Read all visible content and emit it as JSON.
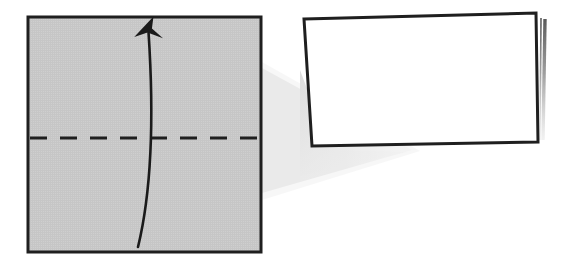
{
  "figure": {
    "kind": "origami-fold-step",
    "background_color": "#ffffff",
    "ink_color": "#1a1a1a",
    "panel_count": 2
  },
  "palette": {
    "paper_gray": "#c6c6c6",
    "paper_gray_light": "#cfcfcf",
    "paper_white": "#ffffff",
    "outline": "#1f1f1f",
    "outline_soft": "#3a3a3a",
    "beam_shadow": "#e2e2e2",
    "beam_shadow_soft": "#ededed",
    "back_layer_edge": "#9a9a9a",
    "drop_shadow": "#e6e6e6"
  },
  "before_panel": {
    "name": "unfolded-sheet",
    "label": "Gray square sheet, unfolded",
    "shape": "square",
    "fill": "#c6c6c6",
    "stroke": "#1f1f1f",
    "stroke_width": 3,
    "x": 28,
    "y": 17,
    "width": 233,
    "height": 235,
    "crease": {
      "name": "horizontal-valley-crease",
      "label": "Horizontal crease line (fold here)",
      "style": "dashed",
      "y": 138,
      "x_start": 30,
      "x_end": 260,
      "stroke": "#1f1f1f",
      "stroke_width": 3,
      "dash_pattern": "17 13"
    },
    "fold_arrow": {
      "name": "fold-direction-arrow",
      "label": "Curved arrow: fold bottom edge up",
      "direction": "upward",
      "stroke": "#1a1a1a",
      "stroke_width": 2.6,
      "tail_x": 138,
      "tail_y": 247,
      "tip_x": 149,
      "tip_y": 22,
      "bulge": "left",
      "head_length": 26,
      "head_width": 15
    }
  },
  "transition": {
    "name": "motion-beam",
    "label": "Light gray beam connecting the two steps",
    "fill": "#e4e4e4",
    "from_x": 262,
    "from_top_y": 68,
    "from_bottom_y": 193,
    "apex_x": 412,
    "apex_y": 150
  },
  "after_panel": {
    "name": "folded-sheet",
    "label": "White rectangle, folded in half",
    "shape": "parallelogram",
    "fill": "#ffffff",
    "stroke": "#1f1f1f",
    "stroke_width": 3,
    "corners": {
      "top_left": [
        304,
        19
      ],
      "top_right": [
        536,
        13
      ],
      "bottom_right": [
        538,
        142
      ],
      "bottom_left": [
        312,
        146
      ]
    },
    "back_layer": {
      "name": "back-layer-edge",
      "label": "Edge of the hidden back layer of paper",
      "stroke": "#6f6f6f",
      "stroke_width": 2,
      "top_x": 545,
      "top_y": 19,
      "bottom_x": 543,
      "bottom_y": 140,
      "fades_downward": true
    },
    "ground_shadow": {
      "name": "folded-sheet-drop-shadow",
      "label": "Soft shadow under the folded sheet",
      "fill": "#ececec"
    }
  },
  "annotations": {
    "step_description": "Fold the square sheet in half along the dashed horizontal crease, bringing the bottom edge up to the top edge.",
    "result_description": "The result is a rectangle half the height of the original square, with the folded edge at the bottom."
  }
}
